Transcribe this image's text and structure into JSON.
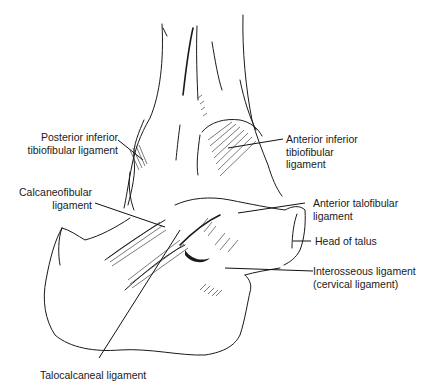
{
  "figure": {
    "labels": {
      "posterior_inferior_tibiofibular": [
        "Posterior inferior",
        "tibiofibular ligament"
      ],
      "anterior_inferior_tibiofibular": [
        "Anterior inferior",
        "tibiofibular",
        "ligament"
      ],
      "calcaneofibular": [
        "Calcaneofibular",
        "ligament"
      ],
      "anterior_talofibular": [
        "Anterior talofibular",
        "ligament"
      ],
      "head_of_talus": [
        "Head of talus"
      ],
      "interosseous": [
        "Interosseous ligament",
        "(cervical ligament)"
      ],
      "talocalcaneal": [
        "Talocalcaneal ligament"
      ]
    }
  }
}
